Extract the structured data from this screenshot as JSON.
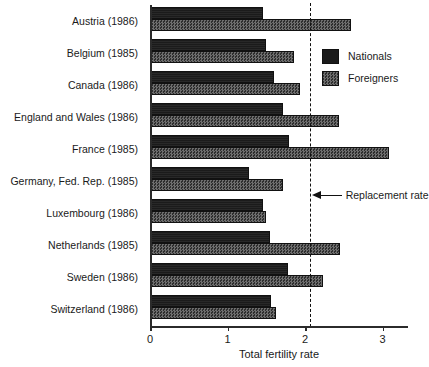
{
  "chart_data": {
    "type": "bar",
    "orientation": "horizontal",
    "title": "",
    "xlabel": "Total fertility rate",
    "ylabel": "",
    "xlim": [
      0,
      3.33
    ],
    "xticks": [
      0,
      1,
      2,
      3
    ],
    "xtick_labels": [
      "0",
      "1",
      "2",
      "3"
    ],
    "grid": false,
    "legend_position": "upper right",
    "categories": [
      "Austria (1986)",
      "Belgium (1985)",
      "Canada (1986)",
      "England and Wales (1986)",
      "France (1985)",
      "Germany, Fed. Rep. (1985)",
      "Luxembourg (1986)",
      "Netherlands (1985)",
      "Sweden (1986)",
      "Switzerland (1986)"
    ],
    "series": [
      {
        "name": "Nationals",
        "values": [
          1.45,
          1.48,
          1.59,
          1.7,
          1.78,
          1.27,
          1.45,
          1.54,
          1.77,
          1.55
        ]
      },
      {
        "name": "Foreigners",
        "values": [
          2.58,
          1.84,
          1.92,
          2.42,
          3.07,
          1.7,
          1.48,
          2.44,
          2.22,
          1.61
        ]
      }
    ],
    "annotations": [
      {
        "label": "Replacement rate",
        "value": 2.06,
        "style": "dashed-vertical-line",
        "arrow": "left"
      }
    ]
  },
  "legend": {
    "items": [
      {
        "label": "Nationals"
      },
      {
        "label": "Foreigners"
      }
    ]
  },
  "annotation": {
    "replacement_rate_label": "Replacement rate"
  },
  "colors": {
    "nationals": "#1b1b1b",
    "foreigners": "#4a4a4a",
    "axis": "#2b2b2b",
    "background": "#ffffff"
  }
}
